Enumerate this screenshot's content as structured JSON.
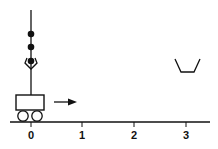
{
  "diagram": {
    "axis": {
      "ticks": [
        "0",
        "1",
        "2",
        "3"
      ]
    },
    "elements": {
      "cart": "cart",
      "arrow": "motion-arrow-right",
      "gripper": "claw-gripper",
      "balls": 3,
      "bucket": "bucket"
    },
    "colors": {
      "ink": "#111111",
      "background": "#ffffff"
    }
  }
}
